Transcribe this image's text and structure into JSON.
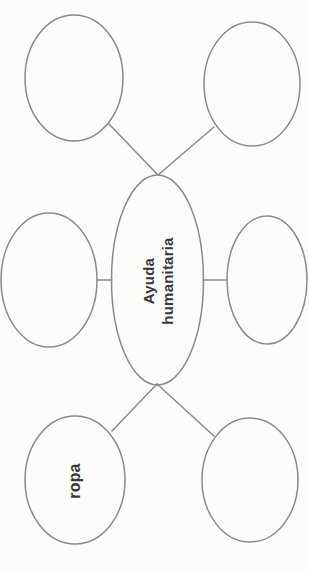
{
  "diagram": {
    "type": "concept-map",
    "orientation": "rotated-90-ccw",
    "central": {
      "label": "Ayuda humanitaria",
      "label_lines": [
        "Ayuda",
        "humanitaria"
      ]
    },
    "nodes": [
      {
        "id": "top-left",
        "label": ""
      },
      {
        "id": "top-right",
        "label": ""
      },
      {
        "id": "middle-left",
        "label": ""
      },
      {
        "id": "middle-right",
        "label": ""
      },
      {
        "id": "bottom-left",
        "label": "ropa"
      },
      {
        "id": "bottom-right",
        "label": ""
      }
    ],
    "connector_count": 6,
    "colors": {
      "stroke": "#8a8a8a",
      "text": "#383838",
      "background": "#fcfcfb"
    }
  }
}
